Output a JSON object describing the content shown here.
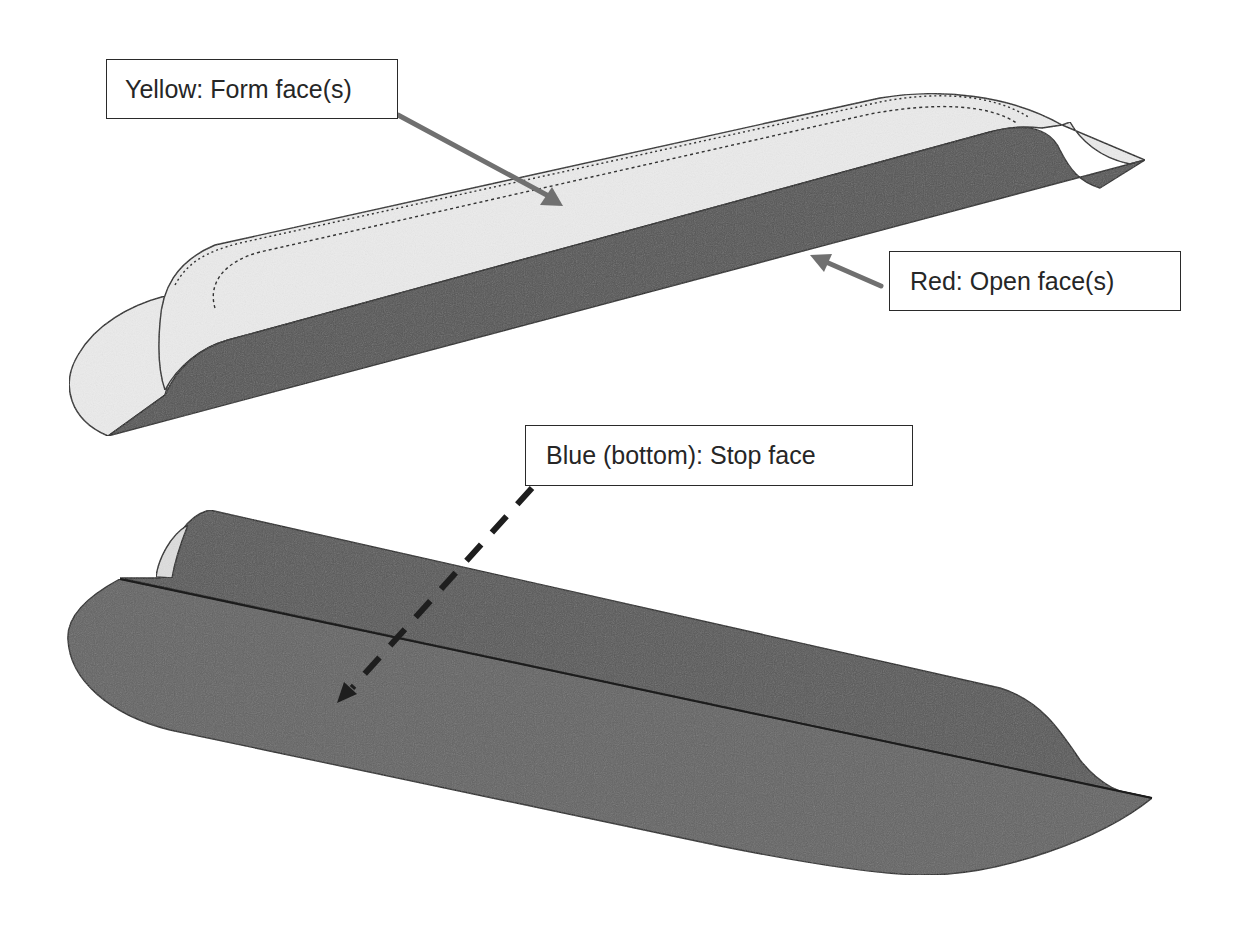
{
  "figure": {
    "colors": {
      "background": "#ffffff",
      "form_face_fill": "#ebebeb",
      "open_face_fill": "#555555",
      "stop_face_fill": "#646464",
      "edge_stroke": "#222222",
      "solid_arrow": "#707070",
      "dashed_arrow": "#1e1e1e",
      "callout_border": "#2a2a2a",
      "callout_text": "#262626"
    }
  },
  "callouts": {
    "form_face": {
      "label": "Yellow: Form face(s)",
      "color_name": "Yellow",
      "role": "Form face(s)",
      "arrow_style": "solid"
    },
    "open_face": {
      "label": "Red: Open face(s)",
      "color_name": "Red",
      "role": "Open face(s)",
      "arrow_style": "solid"
    },
    "stop_face": {
      "label": "Blue (bottom): Stop face",
      "color_name": "Blue (bottom)",
      "role": "Stop face",
      "arrow_style": "dashed"
    }
  },
  "views": [
    {
      "id": "top-view",
      "shows": [
        "form face (light)",
        "open face (dark side wall)"
      ]
    },
    {
      "id": "bottom-view",
      "shows": [
        "stop face (dark bottom)"
      ]
    }
  ]
}
